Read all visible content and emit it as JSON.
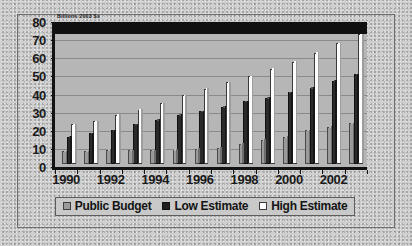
{
  "chart_data": {
    "type": "bar",
    "title": "",
    "subtitle": "",
    "xlabel": "",
    "ylabel": "Billions 2003 $s",
    "axis_note": "Billions 2003 $s",
    "ylim": [
      0,
      80
    ],
    "ytick_step": 10,
    "yticks": [
      "80",
      "70",
      "60",
      "50",
      "40",
      "30",
      "20",
      "10",
      "0"
    ],
    "grid": true,
    "legend_position": "bottom",
    "categories": [
      "1990",
      "1991",
      "1992",
      "1993",
      "1994",
      "1995",
      "1996",
      "1997",
      "1998",
      "1999",
      "2000",
      "2001",
      "2002",
      "2003"
    ],
    "xtick_labels": [
      "1990",
      "1992",
      "1994",
      "1996",
      "1998",
      "2000",
      "2002"
    ],
    "series": [
      {
        "name": "Public Budget",
        "color": "#9a9a9a",
        "values": [
          7,
          7,
          8,
          7.5,
          7.5,
          8,
          8.5,
          9,
          11,
          13.5,
          15,
          18.5,
          20.5,
          22.5
        ]
      },
      {
        "name": "Low Estimate",
        "color": "#1e1e1e",
        "values": [
          15,
          17,
          18.5,
          22,
          24.5,
          27,
          29,
          31.5,
          34.5,
          36.5,
          39.5,
          42,
          46,
          49.5
        ]
      },
      {
        "name": "High Estimate",
        "color": "#ffffff",
        "values": [
          22,
          23.5,
          27,
          30,
          33.5,
          38,
          41.5,
          45,
          48.5,
          52.5,
          56.5,
          61.5,
          66.5,
          71.5
        ]
      }
    ]
  },
  "legend": {
    "items": [
      {
        "label": "Public Budget"
      },
      {
        "label": "Low Estimate"
      },
      {
        "label": "High Estimate"
      }
    ]
  }
}
